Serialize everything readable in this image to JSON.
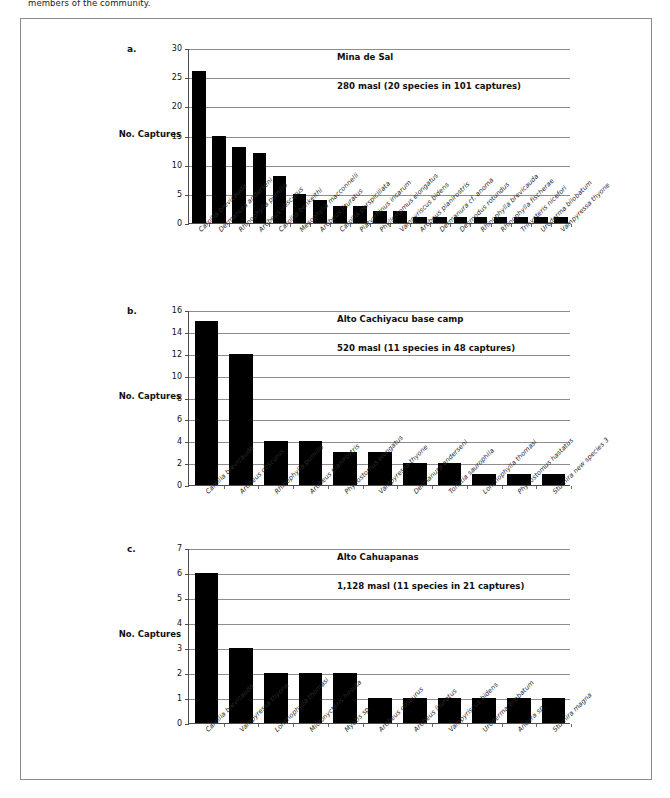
{
  "page": {
    "caption_above": "members of the community."
  },
  "axis_title": "No. Captures",
  "panels": [
    {
      "letter": "a.",
      "site": "Mina de Sal",
      "subtitle": "280 masl (20 species in 101 captures)",
      "chart_data": {
        "type": "bar",
        "title": "Mina de Sal",
        "subtitle": "280 masl (20 species in 101 captures)",
        "xlabel": "",
        "ylabel": "No. Captures",
        "ylim": [
          0,
          30
        ],
        "yticks": [
          0,
          5,
          10,
          15,
          20,
          25,
          30
        ],
        "grid": true,
        "legend": "none",
        "categories": [
          "Carollia brevicauda",
          "Dermanura anderseni",
          "Rhinophylla pumilio",
          "Artibeus obscurus",
          "Carollia benkeithi",
          "Mesophylla macconnelli",
          "Artibeus lituratus",
          "Carollia perspicillata",
          "Platyrrhinus incarum",
          "Phyllostomus elongatus",
          "Vampyriscus bidens",
          "Artibeus planirostris",
          "Dermanura cf. anoma",
          "Desmodus rotundus",
          "Rhinophylla brevicauda",
          "Rhinophylla fischerae",
          "Trinycteris nicefori",
          "Uroderma bilobatum",
          "Vampyressa thyone"
        ],
        "values": [
          26,
          15,
          13,
          12,
          8,
          5,
          4,
          3,
          3,
          2,
          2,
          1,
          1,
          1,
          1,
          1,
          1,
          1,
          1
        ]
      }
    },
    {
      "letter": "b.",
      "site": "Alto Cachiyacu base camp",
      "subtitle": "520 masl (11 species in 48 captures)",
      "chart_data": {
        "type": "bar",
        "title": "Alto Cachiyacu base camp",
        "subtitle": "520 masl (11 species in 48 captures)",
        "xlabel": "",
        "ylabel": "No. Captures",
        "ylim": [
          0,
          16
        ],
        "yticks": [
          0,
          2,
          4,
          6,
          8,
          10,
          12,
          14,
          16
        ],
        "grid": true,
        "legend": "none",
        "categories": [
          "Carollia brevicauda",
          "Artibeus obscurus",
          "Rhinophylla pumilio",
          "Artibeus planirostris",
          "Phyllostomus elongatus",
          "Vampyressa thyone",
          "Dermanura anderseni",
          "Tonatia saurophila",
          "Lonchophylla thomasi",
          "Phyllostomus hastatus",
          "Sturnira new species 3"
        ],
        "values": [
          15,
          12,
          4,
          4,
          3,
          3,
          2,
          2,
          1,
          1,
          1
        ]
      }
    },
    {
      "letter": "c.",
      "site": "Alto Cahuapanas",
      "subtitle": "1,128 masl (11 species in 21 captures)",
      "chart_data": {
        "type": "bar",
        "title": "Alto Cahuapanas",
        "subtitle": "1,128 masl (11 species in 21 captures)",
        "xlabel": "",
        "ylabel": "No. Captures",
        "ylim": [
          0,
          7
        ],
        "yticks": [
          0,
          1,
          2,
          3,
          4,
          5,
          6,
          7
        ],
        "grid": true,
        "legend": "none",
        "categories": [
          "Carollia brevicauda",
          "Vampyressa thyone",
          "Lonchophylla thomasi",
          "Micronycteris hirsuta",
          "Myotis sp.",
          "Artibeus obscurus",
          "Artibeus lituratus",
          "Vampyriscus bidens",
          "Uroderma bilobatum",
          "Anoura sp.",
          "Sturnira magna"
        ],
        "values": [
          6,
          3,
          2,
          2,
          2,
          1,
          1,
          1,
          1,
          1,
          1
        ]
      }
    }
  ]
}
